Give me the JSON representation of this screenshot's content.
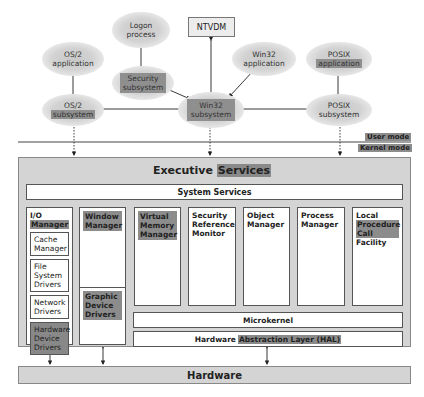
{
  "user_mode": {
    "logon_process": [
      "Logon",
      "process"
    ],
    "ntvdm": "NTVDM",
    "os2_application": [
      "OS/2",
      "application"
    ],
    "win32_application": [
      "Win32",
      "application"
    ],
    "posix_application": [
      "POSIX",
      "application"
    ],
    "security_subsystem": [
      "Security",
      "subsystem"
    ],
    "os2_subsystem": [
      "OS/2",
      "subsystem"
    ],
    "win32_subsystem": [
      "Win32",
      "subsystem"
    ],
    "posix_subsystem": [
      "POSIX",
      "subsystem"
    ]
  },
  "mode_labels": {
    "user": "User mode",
    "kernel": "Kernel mode"
  },
  "executive": {
    "title_plain": "Executive",
    "title_highlight": "Services",
    "system_services": "System Services",
    "io_manager": {
      "title_line1": "I/O",
      "title_line2": "Manager",
      "items": [
        {
          "label": "Cache Manager",
          "highlight": false
        },
        {
          "label": "File System Drivers",
          "highlight": false
        },
        {
          "label": "Network Drivers",
          "highlight": false
        },
        {
          "label": "Hardware Device Drivers",
          "highlight": true
        }
      ]
    },
    "window_manager": "Window Manager",
    "graphic_device_drivers": "Graphic Device Drivers",
    "virtual_memory_manager": "Virtual Memory Manager",
    "security_reference_monitor": "Security Reference Monitor",
    "object_manager": "Object Manager",
    "process_manager": "Process Manager",
    "lpc": {
      "line1": "Local",
      "highlight": "Procedure Call",
      "line3": "Facility"
    },
    "microkernel": "Microkernel",
    "hal_plain": "Hardware",
    "hal_highlight": "Abstraction Layer (HAL)"
  },
  "hardware": "Hardware",
  "colors": {
    "panel_gray": "#d4d4d4",
    "highlight_gray": "#8c8c8c",
    "border": "#555555"
  }
}
